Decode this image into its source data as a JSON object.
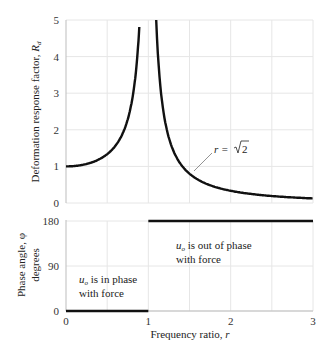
{
  "chart_data": [
    {
      "type": "line",
      "title": "",
      "xlabel": "",
      "ylabel": "Deformation response factor, R_d",
      "ylabel_main": "Deformation response factor, ",
      "ylabel_symbol": "R",
      "ylabel_sub": "d",
      "xlim": [
        0,
        3
      ],
      "ylim": [
        0,
        5
      ],
      "yticks": [
        0,
        1,
        2,
        3,
        4,
        5
      ],
      "grid": true,
      "formula": "R_d = 1/|1 - r^2|",
      "series": [
        {
          "name": "R_d",
          "x": [
            0,
            0.2,
            0.4,
            0.5,
            0.6,
            0.7,
            0.8,
            0.85,
            0.894,
            1.095,
            1.2,
            1.3,
            1.414,
            1.6,
            1.8,
            2.0,
            2.2,
            2.4,
            2.6,
            2.8,
            3.0
          ],
          "values": [
            1.0,
            1.04,
            1.19,
            1.33,
            1.56,
            1.96,
            2.78,
            3.6,
            5.0,
            5.0,
            2.27,
            1.45,
            1.0,
            0.64,
            0.45,
            0.33,
            0.26,
            0.21,
            0.17,
            0.15,
            0.125
          ]
        }
      ],
      "annotations": [
        {
          "text_main": "r = ",
          "text_root": "2",
          "x": 1.414,
          "y": 1.0,
          "label": "r = √2"
        }
      ]
    },
    {
      "type": "line",
      "title": "",
      "xlabel": "Frequency ratio, r",
      "xlabel_main": "Frequency ratio, ",
      "xlabel_symbol": "r",
      "ylabel": "Phase angle, φ degrees",
      "ylabel_line1": "Phase angle, φ",
      "ylabel_line2": "degrees",
      "xlim": [
        0,
        3
      ],
      "ylim": [
        0,
        180
      ],
      "xticks": [
        0,
        1,
        2,
        3
      ],
      "yticks": [
        0,
        90,
        180
      ],
      "grid": true,
      "series": [
        {
          "name": "phi",
          "x": [
            0,
            1,
            1,
            3
          ],
          "values": [
            0,
            0,
            180,
            180
          ]
        }
      ],
      "annotations": [
        {
          "line1_sym": "u",
          "line1_sub": "o",
          "line1_rest": " is out of phase",
          "line2": "with force",
          "x": 1.3,
          "y": 150
        },
        {
          "line1_sym": "u",
          "line1_sub": "o",
          "line1_rest": " is in phase",
          "line2": "with force",
          "x": 0.15,
          "y": 45
        }
      ]
    }
  ]
}
